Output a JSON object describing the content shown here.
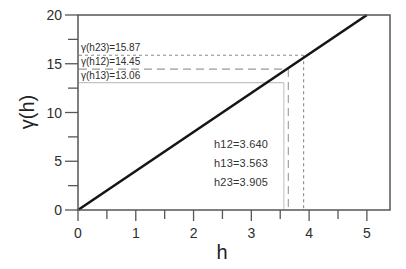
{
  "chart_data": {
    "type": "line",
    "title": "",
    "xlabel": "h",
    "ylabel": "γ(h)",
    "xlim": [
      0,
      5.4
    ],
    "ylim": [
      0,
      20
    ],
    "x_major_ticks": [
      0,
      1,
      2,
      3,
      4,
      5
    ],
    "x_minor_ticks": [
      0.5,
      1.5,
      2.5,
      3.5,
      4.5
    ],
    "y_major_ticks": [
      0,
      5,
      10,
      15,
      20
    ],
    "y_minor_ticks": [
      2.5,
      7.5,
      12.5,
      17.5
    ],
    "grid": "off",
    "legend": "none",
    "series": [
      {
        "name": "linear-variogram-model",
        "x": [
          0,
          5
        ],
        "y": [
          0,
          20
        ],
        "color": "#151515"
      }
    ],
    "reference_lines": [
      {
        "id": "h23",
        "gamma": 15.87,
        "h": 3.905,
        "gamma_label": "γ(h23)=15.87",
        "dash": "short",
        "color": "#8a8a8a"
      },
      {
        "id": "h12",
        "gamma": 14.45,
        "h": 3.64,
        "gamma_label": "γ(h12)=14.45",
        "dash": "long",
        "color": "#9a9a9a"
      },
      {
        "id": "h13",
        "gamma": 13.06,
        "h": 3.563,
        "gamma_label": "γ(h13)=13.06",
        "dash": "solid",
        "color": "#c3c3c3"
      }
    ],
    "annotations": [
      "h12=3.640",
      "h13=3.563",
      "h23=3.905"
    ]
  },
  "colors": {
    "axis": "#565656",
    "text": "#2d2d2d",
    "model_line": "#151515",
    "background": "#ffffff"
  }
}
